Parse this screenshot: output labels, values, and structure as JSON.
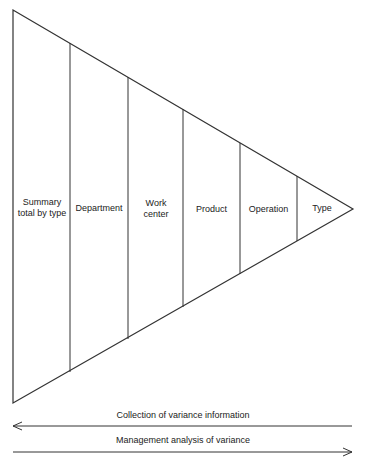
{
  "diagram": {
    "type": "funnel-triangle",
    "segments": [
      {
        "label": "Summary total by type"
      },
      {
        "label": "Department"
      },
      {
        "label": "Work center"
      },
      {
        "label": "Product"
      },
      {
        "label": "Operation"
      },
      {
        "label": "Type"
      }
    ],
    "arrows": [
      {
        "label": "Collection of variance information",
        "direction": "left"
      },
      {
        "label": "Management analysis of variance",
        "direction": "right"
      }
    ],
    "colors": {
      "line": "#333333",
      "background": "#ffffff"
    }
  }
}
